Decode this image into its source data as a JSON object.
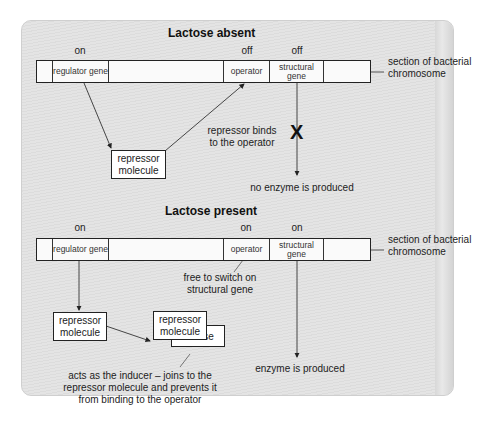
{
  "absent": {
    "title": "Lactose absent",
    "states": {
      "regulator": "on",
      "operator": "off",
      "structural": "off"
    },
    "segments": {
      "regulator": "regulator gene",
      "operator": "operator",
      "structural": "structural gene"
    },
    "chromosome_label": "section of bacterial chromosome",
    "repressor_box": "repressor molecule",
    "binds_label": "repressor binds to the operator",
    "block_mark": "X",
    "result": "no enzyme is produced"
  },
  "present": {
    "title": "Lactose present",
    "states": {
      "regulator": "on",
      "operator": "on",
      "structural": "on"
    },
    "segments": {
      "regulator": "regulator gene",
      "operator": "operator",
      "structural": "structural gene"
    },
    "chromosome_label": "section of bacterial chromosome",
    "free_label": "free to switch on structural gene",
    "repressor_box": "repressor molecule",
    "bound_repressor_box": "repressor molecule",
    "lactose_box": "lactose",
    "inducer_label": "acts as the inducer – joins to the repressor molecule and prevents it from binding to the operator",
    "result": "enzyme is produced"
  }
}
